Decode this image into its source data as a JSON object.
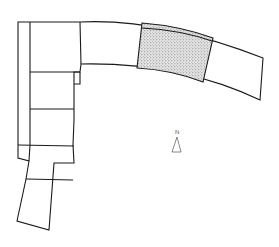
{
  "diagram": {
    "type": "site-plan",
    "colors": {
      "line": "#1a1a1a",
      "highlight_fill": "#c8c8c8",
      "background": "#ffffff",
      "north_arrow": "#555555"
    },
    "north_arrow": {
      "label": "N"
    },
    "highlighted_section": {
      "label": "",
      "pattern": "stippled"
    }
  }
}
